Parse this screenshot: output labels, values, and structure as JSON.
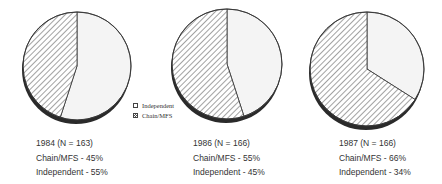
{
  "chart_data": [
    {
      "type": "pie",
      "title": "1984 (N = 163)",
      "n": 163,
      "year": 1984,
      "slices": [
        {
          "label": "Chain/MFS",
          "value": 45,
          "fill": "hatched"
        },
        {
          "label": "Independent",
          "value": 55,
          "fill": "plain"
        }
      ],
      "annotations": [
        "Chain/MFS - 45%",
        "Independent - 55%"
      ]
    },
    {
      "type": "pie",
      "title": "1986 (N = 166)",
      "n": 166,
      "year": 1986,
      "slices": [
        {
          "label": "Chain/MFS",
          "value": 55,
          "fill": "hatched"
        },
        {
          "label": "Independent",
          "value": 45,
          "fill": "plain"
        }
      ],
      "annotations": [
        "Chain/MFS - 55%",
        "Independent - 45%"
      ]
    },
    {
      "type": "pie",
      "title": "1987 (N = 166)",
      "n": 166,
      "year": 1987,
      "slices": [
        {
          "label": "Chain/MFS",
          "value": 66,
          "fill": "hatched"
        },
        {
          "label": "Independent",
          "value": 34,
          "fill": "plain"
        }
      ],
      "annotations": [
        "Chain/MFS - 66%",
        "Independent - 34%"
      ]
    }
  ],
  "legend": {
    "position": "between first and second pie",
    "items": [
      {
        "label": "Independent",
        "fill": "plain"
      },
      {
        "label": "Chain/MFS",
        "fill": "hatched"
      }
    ]
  },
  "pies": [
    {
      "cx": 77,
      "cy": 66,
      "r": 54,
      "chain_pct": 45,
      "title": "1984 (N = 163)",
      "line1": "Chain/MFS - 45%",
      "line2": "Independent - 55%"
    },
    {
      "cx": 227,
      "cy": 64,
      "r": 55,
      "chain_pct": 55,
      "title": "1986 (N = 166)",
      "line1": "Chain/MFS - 55%",
      "line2": "Independent - 45%"
    },
    {
      "cx": 367,
      "cy": 69,
      "r": 57,
      "chain_pct": 66,
      "title": "1987 (N = 166)",
      "line1": "Chain/MFS - 66%",
      "line2": "Independent - 34%"
    }
  ],
  "colors": {
    "independent_fill": "#f4f4f4",
    "hatch_line": "#555555",
    "outline": "#333333",
    "shadow": "#2a2a2a"
  }
}
